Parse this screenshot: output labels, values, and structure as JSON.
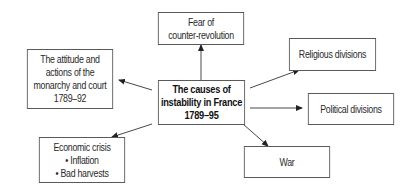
{
  "diagram": {
    "center": {
      "lines": [
        "The causes of",
        "instability in France",
        "1789–95"
      ]
    },
    "nodes": {
      "fear": {
        "lines": [
          "Fear of",
          "counter-revolution"
        ]
      },
      "monarchy": {
        "lines": [
          "The attitude and",
          "actions of the",
          "monarchy and court",
          "1789–92"
        ]
      },
      "religious": {
        "lines": [
          "Religious divisions"
        ]
      },
      "political": {
        "lines": [
          "Political divisions"
        ]
      },
      "economic": {
        "lines": [
          "Economic crisis",
          "• Inflation",
          "• Bad harvests"
        ]
      },
      "war": {
        "lines": [
          "War"
        ]
      }
    },
    "colors": {
      "border": "#5a5a5a",
      "arrow": "#333333",
      "background": "#ffffff"
    }
  }
}
